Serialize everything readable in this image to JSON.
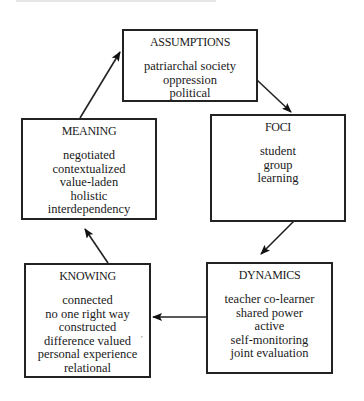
{
  "diagram": {
    "type": "cycle",
    "nodes": [
      {
        "id": "assumptions",
        "title": "ASSUMPTIONS",
        "items": [
          "patriarchal society",
          "oppression",
          "political"
        ]
      },
      {
        "id": "foci",
        "title": "FOCI",
        "items": [
          "student",
          "group",
          "learning"
        ]
      },
      {
        "id": "dynamics",
        "title": "DYNAMICS",
        "items": [
          "teacher co-learner",
          "shared power",
          "active",
          "self-monitoring",
          "joint evaluation"
        ]
      },
      {
        "id": "knowing",
        "title": "KNOWING",
        "items": [
          "connected",
          "no one right way",
          "constructed",
          "difference valued",
          "personal experience",
          "relational"
        ]
      },
      {
        "id": "meaning",
        "title": "MEANING",
        "items": [
          "negotiated",
          "contextualized",
          "value-laden",
          "holistic",
          "interdependency"
        ]
      }
    ],
    "edges": [
      {
        "from": "assumptions",
        "to": "foci"
      },
      {
        "from": "foci",
        "to": "dynamics"
      },
      {
        "from": "dynamics",
        "to": "knowing"
      },
      {
        "from": "knowing",
        "to": "meaning"
      },
      {
        "from": "meaning",
        "to": "assumptions"
      }
    ],
    "stray_mark": "'"
  },
  "colors": {
    "line": "#222222",
    "background": "#ffffff",
    "text": "#1a1a1a"
  }
}
